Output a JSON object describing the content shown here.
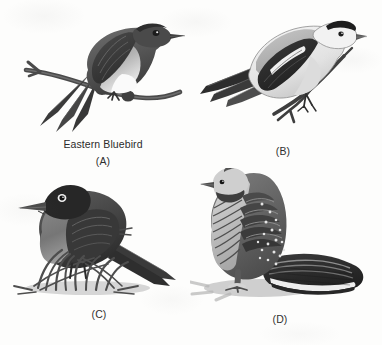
{
  "figure": {
    "type": "scanned-grayscale-illustration-plate",
    "layout": "2x2 grid of bird illustrations",
    "background_color": "#fdfdfc",
    "ink_color": "#2f2f2f"
  },
  "panels": [
    {
      "id": "A",
      "label": "(A)",
      "species_name": "Eastern Bluebird",
      "subject": "perched songbird on bare branch, dark upperparts, pale breast, white belly, long dark tail crossing branch",
      "icon": "bird-perched-on-branch-icon"
    },
    {
      "id": "B",
      "label": "(B)",
      "species_name": "",
      "subject": "finch with black cap, pale body, black wing with white wingbar, perched on forked twig",
      "icon": "bird-goldfinch-icon"
    },
    {
      "id": "C",
      "label": "(C)",
      "species_name": "",
      "subject": "robin-like thrush with dark head, white eye-ring, rufous breast, standing on grass tuft",
      "icon": "bird-robin-on-grass-icon"
    },
    {
      "id": "D",
      "label": "(D)",
      "species_name": "",
      "subject": "crested grouse with speckled and barred plumage, broad black and white banded fan tail, cast shadow",
      "icon": "bird-grouse-icon"
    }
  ]
}
